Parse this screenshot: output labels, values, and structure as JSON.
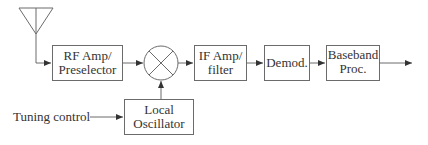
{
  "diagram": {
    "type": "block-diagram",
    "colors": {
      "line": "#6b6b6b",
      "text": "#333333",
      "background": "#ffffff"
    },
    "blocks": [
      {
        "id": "rf-amp",
        "lines": [
          "RF Amp/",
          "Preselector"
        ]
      },
      {
        "id": "if-amp",
        "lines": [
          "IF Amp/",
          "filter"
        ]
      },
      {
        "id": "demod",
        "lines": [
          "Demod."
        ]
      },
      {
        "id": "baseband",
        "lines": [
          "Baseband",
          "Proc."
        ]
      },
      {
        "id": "local-osc",
        "lines": [
          "Local",
          "Oscillator"
        ]
      }
    ],
    "mixer": {
      "symbol": "circle-with-x"
    },
    "antenna": {
      "symbol": "triangle-antenna"
    },
    "inputs": {
      "tuning_label": "Tuning control"
    },
    "connections": [
      "antenna -> rf-amp",
      "rf-amp -> mixer",
      "local-osc -> mixer",
      "mixer -> if-amp",
      "if-amp -> demod",
      "demod -> baseband",
      "baseband -> output",
      "tuning-control -> local-osc"
    ]
  }
}
